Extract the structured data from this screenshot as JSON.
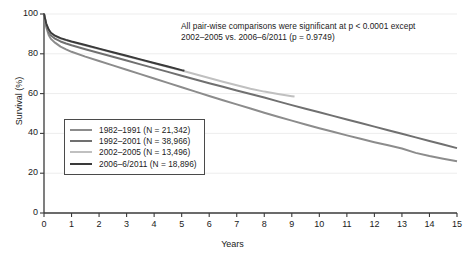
{
  "chart_data": {
    "type": "line",
    "title": "",
    "xlabel": "Years",
    "ylabel": "Survival (%)",
    "xlim": [
      0,
      15
    ],
    "ylim": [
      0,
      100
    ],
    "xticks": [
      0,
      1,
      2,
      3,
      4,
      5,
      6,
      7,
      8,
      9,
      10,
      11,
      12,
      13,
      14,
      15
    ],
    "yticks": [
      0,
      20,
      40,
      60,
      80,
      100
    ],
    "grid": true,
    "legend_position": "inner-left",
    "annotations": [
      "All pair-wise comparisons were significant at p < 0.0001 except",
      "2002–2005 vs. 2006–6/2011 (p = 0.9749)"
    ],
    "series": [
      {
        "name": "1982–1991 (N = 21,342)",
        "label": "1982–1991",
        "n": "21,342",
        "color": "#8c8c8c",
        "width": 2.0,
        "x": [
          0,
          0.08,
          0.17,
          0.25,
          0.4,
          0.6,
          0.8,
          1,
          1.5,
          2,
          2.5,
          3,
          3.5,
          4,
          4.5,
          5,
          5.5,
          6,
          6.5,
          7,
          7.5,
          8,
          8.5,
          9,
          9.5,
          10,
          10.5,
          11,
          11.5,
          12,
          12.5,
          13,
          13.5,
          14,
          14.5,
          15
        ],
        "y": [
          100,
          93.5,
          89.5,
          87.5,
          85.6,
          83.6,
          82.2,
          81,
          78.6,
          76.4,
          74.2,
          72,
          69.8,
          67.6,
          65.4,
          63.2,
          61,
          58.8,
          56.7,
          54.6,
          52.5,
          50.4,
          48.4,
          46.4,
          44.5,
          42.6,
          40.8,
          39,
          37.3,
          35.6,
          34,
          32.4,
          30.2,
          28.6,
          27.3,
          26.0
        ]
      },
      {
        "name": "1992–2001 (N = 38,966)",
        "label": "1992–2001",
        "n": "38,966",
        "color": "#707070",
        "width": 2.0,
        "x": [
          0,
          0.08,
          0.17,
          0.25,
          0.4,
          0.6,
          0.8,
          1,
          1.5,
          2,
          2.5,
          3,
          3.5,
          4,
          4.5,
          5,
          5.5,
          6,
          6.5,
          7,
          7.5,
          8,
          8.5,
          9,
          9.5,
          10,
          10.5,
          11,
          11.5,
          12,
          12.5,
          13,
          13.5,
          14,
          14.5,
          15
        ],
        "y": [
          100,
          94.5,
          91.0,
          89.3,
          87.6,
          86.2,
          85.2,
          84.3,
          82.3,
          80.4,
          78.5,
          76.6,
          74.7,
          72.8,
          70.9,
          69.0,
          67.1,
          65.2,
          63.4,
          61.6,
          59.8,
          58.0,
          56.1,
          54.2,
          52.4,
          50.6,
          48.8,
          47.0,
          45.2,
          43.4,
          41.6,
          39.8,
          38.0,
          36.2,
          34.4,
          32.6
        ]
      },
      {
        "name": "2002–2005 (N = 13,496)",
        "label": "2002–2005",
        "n": "13,496",
        "color": "#c0c0c0",
        "width": 2.0,
        "x": [
          0,
          0.08,
          0.17,
          0.25,
          0.4,
          0.6,
          0.8,
          1,
          1.5,
          2,
          2.5,
          3,
          3.5,
          4,
          4.5,
          5,
          5.5,
          6,
          6.5,
          7,
          7.5,
          8,
          8.5,
          9,
          9.1
        ],
        "y": [
          100,
          95.0,
          92.0,
          90.4,
          88.9,
          87.7,
          86.8,
          86.0,
          84.2,
          82.4,
          80.6,
          78.8,
          77.0,
          75.2,
          73.4,
          71.6,
          69.7,
          67.8,
          66.0,
          64.2,
          62.4,
          61.0,
          59.8,
          58.7,
          58.5
        ]
      },
      {
        "name": "2006–6/2011 (N = 18,896)",
        "label": "2006–6/2011",
        "n": "18,896",
        "color": "#3a3a3a",
        "width": 2.0,
        "x": [
          0,
          0.08,
          0.17,
          0.25,
          0.4,
          0.6,
          0.8,
          1,
          1.5,
          2,
          2.5,
          3,
          3.5,
          4,
          4.5,
          5,
          5.1
        ],
        "y": [
          100,
          95.2,
          92.2,
          90.6,
          89.1,
          87.9,
          87.0,
          86.2,
          84.4,
          82.6,
          80.8,
          79.0,
          77.2,
          75.4,
          73.6,
          71.8,
          71.5
        ]
      }
    ]
  },
  "axes": {
    "ylabel": "Survival (%)",
    "xlabel": "Years"
  }
}
